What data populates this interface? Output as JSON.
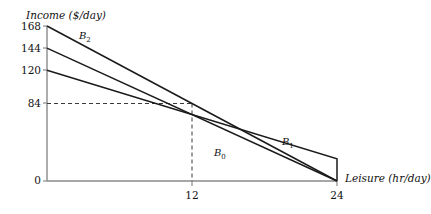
{
  "chart_data": {
    "type": "line",
    "title": "",
    "xlabel": "Leisure (hr/day)",
    "ylabel": "Income ($/day)",
    "xlim": [
      0,
      26
    ],
    "ylim": [
      0,
      176
    ],
    "grid": false,
    "legend_position": "inline-annotations",
    "x_ticks": [
      "12",
      "24"
    ],
    "x_tick_values": [
      12,
      24
    ],
    "y_ticks": [
      "168",
      "144",
      "120",
      "84",
      "0"
    ],
    "y_tick_values": [
      168,
      144,
      120,
      84,
      0
    ],
    "annotations": [
      {
        "text": "B",
        "sub": "2",
        "x": 4.6,
        "y": 150
      },
      {
        "text": "B",
        "sub": "0",
        "x": 13.2,
        "y": 35
      },
      {
        "text": "B",
        "sub": "1",
        "x": 18.6,
        "y": 47
      }
    ],
    "reference_lines": [
      {
        "style": "dashed",
        "from": [
          0,
          84
        ],
        "to": [
          12,
          84
        ]
      },
      {
        "style": "dashed",
        "from": [
          12,
          84
        ],
        "to": [
          12,
          0
        ]
      }
    ],
    "series": [
      {
        "name": "B2",
        "label": "B₂",
        "points": [
          [
            0,
            168
          ],
          [
            24,
            0
          ]
        ]
      },
      {
        "name": "B0",
        "label": "B₀",
        "points": [
          [
            0,
            144
          ],
          [
            24,
            0
          ]
        ]
      },
      {
        "name": "B1",
        "label": "B₁",
        "points": [
          [
            0,
            120
          ],
          [
            24,
            24
          ],
          [
            24,
            0
          ]
        ]
      }
    ]
  },
  "axes": {
    "y_axis_title": "Income ($/day)",
    "x_axis_title": "Leisure (hr/day)",
    "y_tick_168": "168",
    "y_tick_144": "144",
    "y_tick_120": "120",
    "y_tick_84": "84",
    "y_tick_0": "0",
    "x_tick_12": "12",
    "x_tick_24": "24"
  },
  "curves": {
    "b2_base": "B",
    "b2_sub": "2",
    "b0_base": "B",
    "b0_sub": "0",
    "b1_base": "B",
    "b1_sub": "1"
  },
  "colors": {
    "line": "#1a1a1a",
    "axis": "#8a8a8a",
    "text": "#111111",
    "background": "#ffffff"
  }
}
